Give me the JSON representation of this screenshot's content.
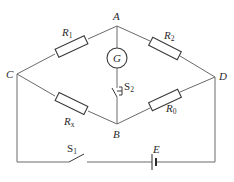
{
  "diagram": {
    "nodes": {
      "A": {
        "label": "A"
      },
      "B": {
        "label": "B"
      },
      "C": {
        "label": "C"
      },
      "D": {
        "label": "D"
      }
    },
    "components": {
      "R1": {
        "main": "R",
        "sub": "1",
        "between": "C-A"
      },
      "R2": {
        "main": "R",
        "sub": "2",
        "between": "A-D"
      },
      "Rx": {
        "main": "R",
        "sub": "x",
        "between": "C-B"
      },
      "R0": {
        "main": "R",
        "sub": "0",
        "between": "B-D"
      },
      "G": {
        "label": "G",
        "between": "A-B"
      },
      "S2": {
        "main": "S",
        "sub": "2",
        "between": "A-B"
      },
      "S1": {
        "main": "S",
        "sub": "1",
        "position": "bottom wire"
      },
      "E": {
        "label": "E",
        "position": "bottom wire"
      }
    }
  }
}
